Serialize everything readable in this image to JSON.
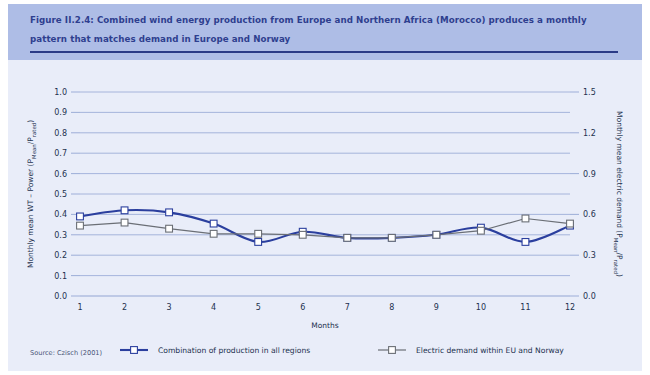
{
  "figure": {
    "title": "Figure II.2.4: Combined wind energy production from Europe and Northern Africa (Morocco) produces a monthly pattern that matches demand in Europe and Norway",
    "source": "Source: Czisch (2001)",
    "colors": {
      "header_band": "#aebde6",
      "panel": "#e9edf9",
      "title_text": "#2e3f8f",
      "title_rule": "#2a3a86",
      "series_production": "#2b3f9e",
      "series_demand": "#6b6f76",
      "gridline": "#94a6d4",
      "marker_fill": "#ffffff"
    }
  },
  "chart_data": {
    "type": "line",
    "title": "",
    "xlabel": "Months",
    "ylabel": "Monthly mean WT – Power (PMean/Prated)",
    "y2label": "Monthly mean electric demand (PMean/Prated)",
    "x": [
      1,
      2,
      3,
      4,
      5,
      6,
      7,
      8,
      9,
      10,
      11,
      12
    ],
    "categories": [
      "1",
      "2",
      "3",
      "4",
      "5",
      "6",
      "7",
      "8",
      "9",
      "10",
      "11",
      "12"
    ],
    "xlim": [
      1,
      12
    ],
    "ylim": [
      0.0,
      1.0
    ],
    "y2lim": [
      0.0,
      1.5
    ],
    "yticks": [
      "0.0",
      "0.1",
      "0.2",
      "0.3",
      "0.4",
      "0.5",
      "0.6",
      "0.7",
      "0.8",
      "0.9",
      "1.0"
    ],
    "ytick_values": [
      0.0,
      0.1,
      0.2,
      0.3,
      0.4,
      0.5,
      0.6,
      0.7,
      0.8,
      0.9,
      1.0
    ],
    "y2ticks": [
      "0.0",
      "0.3",
      "0.6",
      "0.9",
      "1.2",
      "1.5"
    ],
    "y2tick_values": [
      0.0,
      0.3,
      0.6,
      0.9,
      1.2,
      1.5
    ],
    "grid": true,
    "legend_position": "bottom",
    "series": [
      {
        "name": "Combination of production in all regions",
        "axis": "left",
        "color": "#2b3f9e",
        "marker": "square",
        "values": [
          0.39,
          0.42,
          0.41,
          0.355,
          0.265,
          0.315,
          0.285,
          0.285,
          0.3,
          0.335,
          0.265,
          0.345
        ]
      },
      {
        "name": "Electric demand within EU and Norway",
        "axis": "right",
        "color": "#6b6f76",
        "marker": "square",
        "values": [
          0.345,
          0.36,
          0.33,
          0.305,
          0.305,
          0.3,
          0.285,
          0.285,
          0.3,
          0.32,
          0.38,
          0.355
        ]
      }
    ]
  },
  "legend": {
    "items": [
      {
        "label": "Combination of production in all regions"
      },
      {
        "label": "Electric demand within EU and Norway"
      }
    ]
  }
}
